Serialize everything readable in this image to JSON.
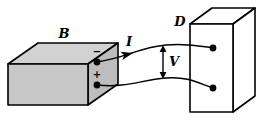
{
  "figure": {
    "kind": "physics-circuit-diagram",
    "width": 263,
    "height": 122,
    "background": "#ffffff"
  },
  "labels": {
    "source_box": "B",
    "detector_box": "D",
    "current": "I",
    "voltage": "V",
    "negative_terminal": "−",
    "positive_terminal": "+"
  },
  "colors": {
    "stroke": "#000000",
    "box_front_fill": "#c8c8c8",
    "box_top_fill": "#d2d2d2",
    "box_side_fill": "#bdbdbd",
    "detector_fill": "#ffffff",
    "terminal_dot": "#000000"
  },
  "geometry": {
    "source_box": {
      "front": "8,64 8,105 88,105 88,64",
      "top": "8,64 38,43 118,43 88,64",
      "side": "88,64 118,43 118,84 88,105"
    },
    "detector_box": {
      "front": "190,24 190,112 233,112 233,24",
      "top": "190,24 212,8 255,8 233,24",
      "side": "233,24 255,8 255,96 233,112"
    },
    "terminals": {
      "source_negative": {
        "cx": 97,
        "cy": 62,
        "r": 3.4
      },
      "source_positive": {
        "cx": 97,
        "cy": 85,
        "r": 3.4
      },
      "detector_top": {
        "cx": 213,
        "cy": 48,
        "r": 3.4
      },
      "detector_bottom": {
        "cx": 213,
        "cy": 88,
        "r": 3.4
      }
    },
    "wires": {
      "top_wire": "M 97,62 C 126,58 140,47 166,45 C 188,43 200,46 213,48",
      "bottom_wire": "M 97,85 C 128,88 140,80 166,78 C 188,76 200,84 213,88"
    },
    "current_arrow": {
      "x": 128,
      "y": 55,
      "angle": -13
    },
    "voltage_arrow": {
      "x": 163,
      "y_top": 46,
      "y_bottom": 78
    }
  },
  "label_positions": {
    "source_box": {
      "x": 64,
      "y": 34
    },
    "detector_box": {
      "x": 180,
      "y": 22
    },
    "current": {
      "x": 129,
      "y": 42
    },
    "voltage": {
      "x": 174,
      "y": 62
    },
    "negative_terminal": {
      "x": 97,
      "y": 52
    },
    "positive_terminal": {
      "x": 97,
      "y": 75
    }
  }
}
